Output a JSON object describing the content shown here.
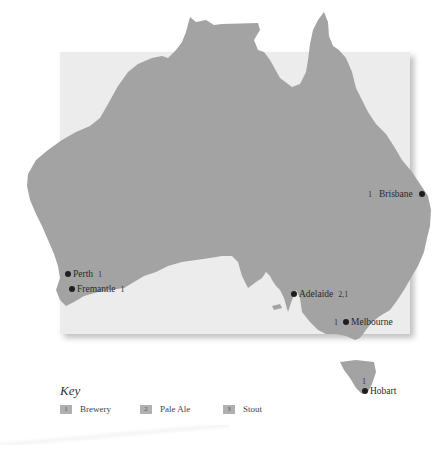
{
  "map": {
    "region": "Australia",
    "land_color": "#a3a3a3",
    "background_color": "#ececec",
    "marker_color": "#1e1e1e",
    "cities": [
      {
        "name": "Brisbane",
        "badge": "1",
        "badge_side": "left"
      },
      {
        "name": "Perth",
        "badge": "1",
        "badge_side": "right"
      },
      {
        "name": "Fremantle",
        "badge": "1",
        "badge_side": "right"
      },
      {
        "name": "Adelaide",
        "badge": "2,1",
        "badge_side": "right"
      },
      {
        "name": "Melbourne",
        "badge": "1",
        "badge_side": "left"
      },
      {
        "name": "Hobart",
        "badge": "1",
        "badge_side": "above"
      }
    ]
  },
  "key": {
    "title": "Key",
    "items": [
      {
        "number": "1",
        "label": "Brewery"
      },
      {
        "number": "2",
        "label": "Pale Ale"
      },
      {
        "number": "3",
        "label": "Stout"
      }
    ]
  }
}
